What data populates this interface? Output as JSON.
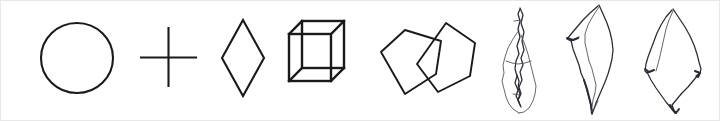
{
  "canvas": {
    "width": 720,
    "height": 121,
    "background_color": "#ffffff",
    "border_color": "#e8e8e8"
  },
  "palette": {
    "reference_stroke": "#1a1a1a",
    "handdrawn_stroke": "#2b2b33",
    "handdrawn_faint_stroke": "#4a4a55"
  },
  "figure": {
    "type": "shape-copying-stimulus-set",
    "shape_count": 8,
    "reference_shape_count": 5,
    "handdrawn_shape_count": 3,
    "shapes": [
      {
        "index": 0,
        "name": "circle",
        "style": "reference",
        "bbox": [
          40,
          22,
          72,
          70
        ],
        "center": [
          76,
          57
        ],
        "radius_x": 36,
        "radius_y": 35
      },
      {
        "index": 1,
        "name": "cross",
        "style": "reference",
        "bbox": [
          139,
          26,
          57,
          60
        ],
        "center": [
          167,
          56
        ],
        "arm_horizontal": 57,
        "arm_vertical": 60
      },
      {
        "index": 2,
        "name": "diamond",
        "style": "reference",
        "bbox": [
          221,
          19,
          43,
          77
        ],
        "center": [
          242,
          57
        ],
        "half_width": 21,
        "half_height": 38
      },
      {
        "index": 3,
        "name": "necker-cube",
        "style": "reference",
        "bbox": [
          287,
          19,
          55,
          62
        ],
        "front_face": [
          294,
          33,
          42,
          47
        ],
        "depth_offset": [
          13,
          -14
        ]
      },
      {
        "index": 4,
        "name": "overlapping-pentagons",
        "style": "reference",
        "bbox": [
          378,
          21,
          97,
          72
        ],
        "pentagon_left_center": [
          412,
          54
        ],
        "pentagon_right_center": [
          443,
          56
        ],
        "intersection_shape": "diamond"
      },
      {
        "index": 5,
        "name": "handdrawn-collapsed-figure",
        "style": "hand-drawn",
        "bbox": [
          500,
          6,
          40,
          107
        ],
        "quality": "tremulous-collapsed"
      },
      {
        "index": 6,
        "name": "handdrawn-diamond-left",
        "style": "hand-drawn",
        "bbox": [
          563,
          4,
          56,
          112
        ],
        "quality": "tremulous"
      },
      {
        "index": 7,
        "name": "handdrawn-diamond-right",
        "style": "hand-drawn",
        "bbox": [
          643,
          8,
          62,
          107
        ],
        "quality": "tremulous"
      }
    ]
  }
}
